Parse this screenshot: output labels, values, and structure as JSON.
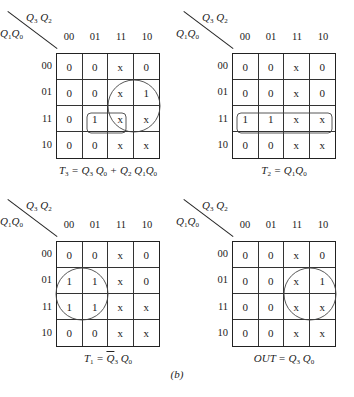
{
  "figure": {
    "col_var_label": "Q3 Q2",
    "row_var_label": "Q1 Q0",
    "col_headers": [
      "00",
      "01",
      "11",
      "10"
    ],
    "row_headers": [
      "00",
      "01",
      "11",
      "10"
    ],
    "subfigure_label": "(b)"
  },
  "maps": [
    {
      "id": "T3",
      "equation": "T3 = Q3 Q0 + Q2 Q1 Q0",
      "cells": [
        [
          "0",
          "0",
          "x",
          "0"
        ],
        [
          "0",
          "0",
          "x",
          "1"
        ],
        [
          "0",
          "1",
          "x",
          "x"
        ],
        [
          "0",
          "0",
          "x",
          "x"
        ]
      ],
      "groupings": [
        {
          "shape": "circle",
          "cells": "rows 01-11, cols 11-10"
        },
        {
          "shape": "rounded-rect",
          "cells": "row 11, cols 01-11"
        }
      ]
    },
    {
      "id": "T2",
      "equation": "T2 = Q1 Q0",
      "cells": [
        [
          "0",
          "0",
          "x",
          "0"
        ],
        [
          "0",
          "0",
          "x",
          "0"
        ],
        [
          "1",
          "1",
          "x",
          "x"
        ],
        [
          "0",
          "0",
          "x",
          "x"
        ]
      ],
      "groupings": [
        {
          "shape": "rounded-rect",
          "cells": "row 11, cols 00-10"
        }
      ]
    },
    {
      "id": "T1",
      "equation": "T1 = Q̄3 Q0",
      "cells": [
        [
          "0",
          "0",
          "x",
          "0"
        ],
        [
          "1",
          "1",
          "x",
          "0"
        ],
        [
          "1",
          "1",
          "x",
          "x"
        ],
        [
          "0",
          "0",
          "x",
          "x"
        ]
      ],
      "groupings": [
        {
          "shape": "circle",
          "cells": "rows 01-11, cols 00-01"
        }
      ]
    },
    {
      "id": "OUT",
      "equation": "OUT = Q3 Q0",
      "cells": [
        [
          "0",
          "0",
          "x",
          "0"
        ],
        [
          "0",
          "0",
          "x",
          "1"
        ],
        [
          "0",
          "0",
          "x",
          "x"
        ],
        [
          "0",
          "0",
          "x",
          "x"
        ]
      ],
      "groupings": [
        {
          "shape": "circle",
          "cells": "rows 01-11, cols 11-10"
        }
      ]
    }
  ]
}
